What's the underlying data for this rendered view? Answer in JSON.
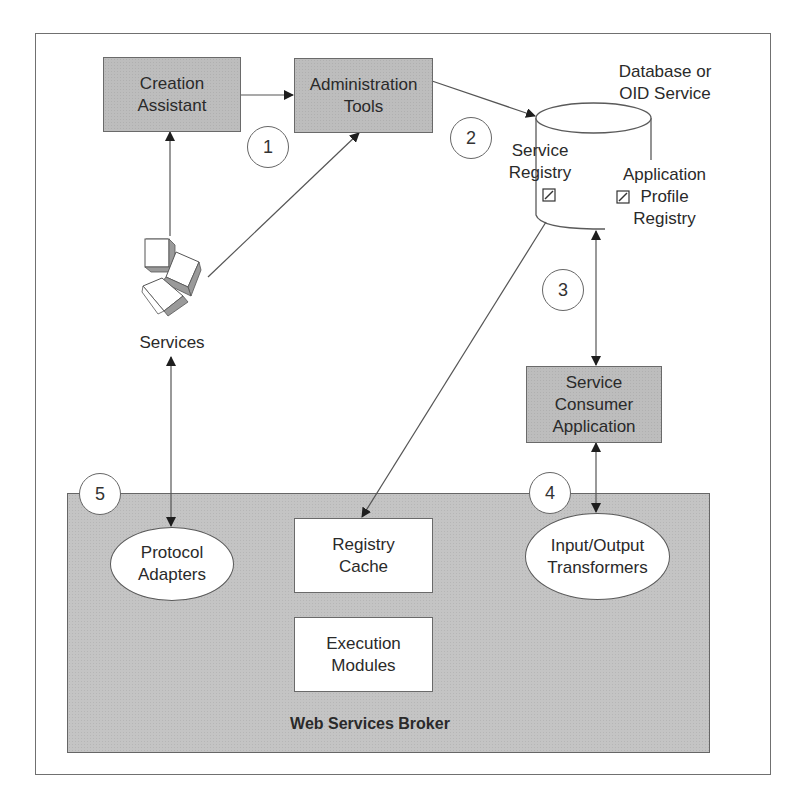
{
  "diagram": {
    "nodes": {
      "creation_assistant": {
        "label": "Creation\nAssistant"
      },
      "administration_tools": {
        "label": "Administration\nTools"
      },
      "database": {
        "label": "Database or\nOID Service"
      },
      "service_registry": {
        "label": "Service\nRegistry"
      },
      "application_profile_registry": {
        "label": "Application\nProfile\nRegistry"
      },
      "services": {
        "label": "Services"
      },
      "service_consumer_application": {
        "label": "Service\nConsumer\nApplication"
      },
      "protocol_adapters": {
        "label": "Protocol\nAdapters"
      },
      "registry_cache": {
        "label": "Registry\nCache"
      },
      "execution_modules": {
        "label": "Execution\nModules"
      },
      "input_output_transformers": {
        "label": "Input/Output\nTransformers"
      },
      "web_services_broker": {
        "label": "Web Services Broker"
      }
    },
    "steps": [
      "1",
      "2",
      "3",
      "4",
      "5"
    ],
    "edges": [
      {
        "from": "creation_assistant",
        "to": "administration_tools",
        "type": "arrow"
      },
      {
        "from": "services",
        "to": "creation_assistant",
        "type": "arrow"
      },
      {
        "from": "services",
        "to": "administration_tools",
        "type": "arrow"
      },
      {
        "from": "administration_tools",
        "to": "database",
        "type": "arrow"
      },
      {
        "from": "database",
        "to": "registry_cache",
        "type": "arrow"
      },
      {
        "from": "database",
        "to": "service_consumer_application",
        "type": "double-arrow"
      },
      {
        "from": "service_consumer_application",
        "to": "input_output_transformers",
        "type": "double-arrow"
      },
      {
        "from": "services",
        "to": "protocol_adapters",
        "type": "double-arrow"
      }
    ],
    "colors": {
      "gray_box": "#bdbdbd",
      "broker_bg": "#c4c4c4",
      "stroke": "#5a5a5a",
      "white": "#ffffff"
    }
  }
}
